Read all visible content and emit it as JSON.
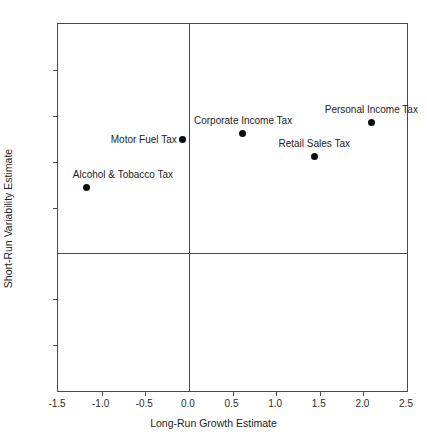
{
  "chart_data": {
    "type": "scatter",
    "title": "",
    "xlabel": "Long-Run Growth Estimate",
    "ylabel": "Short-Run Variability Estimate",
    "xlim": [
      -1.5,
      2.5
    ],
    "ylim": [
      -1.5,
      2.5
    ],
    "xticks": [
      "-1.5",
      "-1.0",
      "-0.5",
      "0.0",
      "0.5",
      "1.0",
      "1.5",
      "2.0",
      "2.5"
    ],
    "xtick_values": [
      -1.5,
      -1.0,
      -0.5,
      0.0,
      0.5,
      1.0,
      1.5,
      2.0,
      2.5
    ],
    "yticks": [
      "2.5",
      "2.0",
      "1.5",
      "1.0",
      "0.5",
      "0.0",
      "-0.5",
      "-1.0",
      "-1.5"
    ],
    "ytick_values": [
      2.5,
      2.0,
      1.5,
      1.0,
      0.5,
      0.0,
      -0.5,
      -1.0,
      -1.5
    ],
    "grid": false,
    "legend": "none",
    "reference_lines": [
      {
        "axis": "x",
        "value": 0.0
      },
      {
        "axis": "y",
        "value": 0.0
      }
    ],
    "marker_color": "#0d0d0d",
    "frame_color": "#4a4a4a",
    "points": [
      {
        "label": "Alcohol & Tobacco Tax",
        "x": -1.17,
        "y": 0.72,
        "label_pos": "above-right"
      },
      {
        "label": "Motor Fuel Tax",
        "x": -0.07,
        "y": 1.24,
        "label_pos": "left"
      },
      {
        "label": "Corporate Income Tax",
        "x": 0.62,
        "y": 1.31,
        "label_pos": "above"
      },
      {
        "label": "Retail Sales Tax",
        "x": 1.44,
        "y": 1.06,
        "label_pos": "above"
      },
      {
        "label": "Personal Income Tax",
        "x": 2.09,
        "y": 1.43,
        "label_pos": "above"
      }
    ]
  }
}
